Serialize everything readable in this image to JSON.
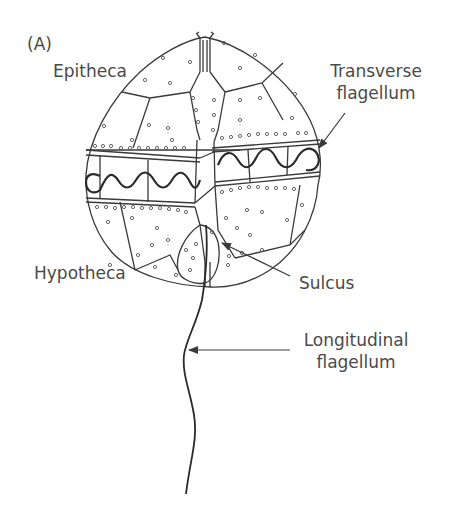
{
  "figure": {
    "panel_label": "(A)",
    "stroke_color": "#3a3a3a",
    "text_color": "#4a4a4a",
    "background": "#ffffff"
  },
  "labels": {
    "epitheca": "Epitheca",
    "transverse_line1": "Transverse",
    "transverse_line2": "flagellum",
    "hypotheca": "Hypotheca",
    "sulcus": "Sulcus",
    "longitudinal_line1": "Longitudinal",
    "longitudinal_line2": "flagellum"
  }
}
